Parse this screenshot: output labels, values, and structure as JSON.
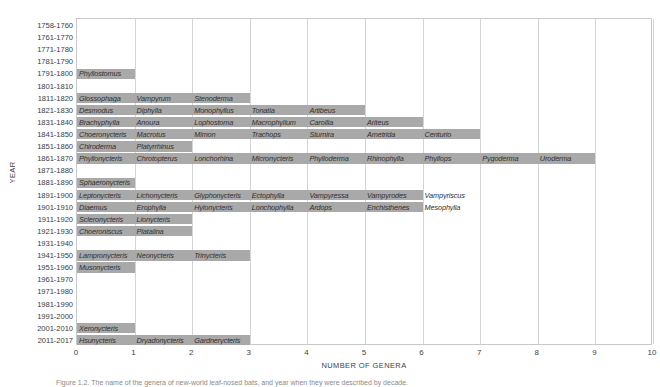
{
  "chart_data": {
    "type": "bar",
    "title": "",
    "xlabel": "NUMBER OF GENERA",
    "ylabel": "YEAR",
    "xlim": [
      0,
      10
    ],
    "xticks": [
      0,
      1,
      2,
      3,
      4,
      5,
      6,
      7,
      8,
      9,
      10
    ],
    "grid": true,
    "orientation": "horizontal",
    "bar_color": "#a9a9a9",
    "categories": [
      "1758-1760",
      "1761-1770",
      "1771-1780",
      "1781-1790",
      "1791-1800",
      "1801-1810",
      "1811-1820",
      "1821-1830",
      "1831-1840",
      "1841-1850",
      "1851-1860",
      "1861-1870",
      "1871-1880",
      "1881-1890",
      "1891-1900",
      "1901-1910",
      "1911-1920",
      "1921-1930",
      "1931-1940",
      "1941-1950",
      "1951-1960",
      "1961-1970",
      "1971-1980",
      "1981-1990",
      "1991-2000",
      "2001-2010",
      "2011-2017"
    ],
    "values": [
      0,
      0,
      0,
      0,
      1,
      0,
      3,
      5,
      6,
      7,
      2,
      9,
      0,
      1,
      6,
      6,
      2,
      2,
      0,
      3,
      1,
      0,
      0,
      0,
      0,
      1,
      3
    ],
    "labels": [
      [],
      [],
      [],
      [],
      [
        "Phyllostomus"
      ],
      [],
      [
        "Glossophaga",
        "Vampyrum",
        "Stenoderma"
      ],
      [
        "Desmodus",
        "Diphylla",
        "Monophyllus",
        "Tonatia",
        "Artibeus"
      ],
      [
        "Brachyphylla",
        "Anoura",
        "Lophostoma",
        "Macrophyllum",
        "Carollia",
        "Ariteus"
      ],
      [
        "Choeronycteris",
        "Macrotus",
        "Mimon",
        "Trachops",
        "Sturnira",
        "Ametrida",
        "Centurio"
      ],
      [
        "Chiroderma",
        "Platyrrhinus"
      ],
      [
        "Phyllonycteris",
        "Chrotopterus",
        "Lonchorhina",
        "Micronycteris",
        "Phylloderma",
        "Rhinophylla",
        "Phyllops",
        "Pygoderma",
        "Uroderma"
      ],
      [],
      [
        "Sphaeronycteris"
      ],
      [
        "Leptonycteris",
        "Lichonycteris",
        "Glyphonycteris",
        "Ectophylla",
        "Vampyressa",
        "Vampyrodes",
        "Vampyriscus"
      ],
      [
        "Diaemus",
        "Erophylla",
        "Hylonycteris",
        "Lonchophylla",
        "Ardops",
        "Enchisthenes",
        "Mesophylla"
      ],
      [
        "Scleronycteris",
        "Lionycteris"
      ],
      [
        "Choeroniscus",
        "Platalina"
      ],
      [],
      [
        "Lampronycteris",
        "Neonycteris",
        "Trinycteris"
      ],
      [
        "Musonycteris"
      ],
      [],
      [],
      [],
      [],
      [
        "Xeronycteris"
      ],
      [
        "Hsunycteris",
        "Dryadonycteris",
        "Gardnerycteris"
      ]
    ]
  },
  "caption": "Figure 1.2. The name of the genera of new-world leaf-nosed bats, and year when they were described by decade."
}
